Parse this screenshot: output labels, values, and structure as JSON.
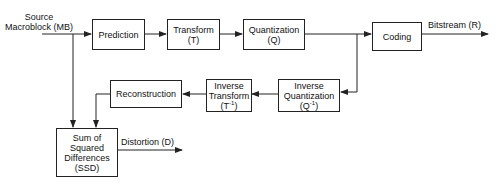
{
  "diagram": {
    "input_label": [
      "Source",
      "Macroblock (MB)"
    ],
    "nodes": {
      "prediction": {
        "lines": [
          "Prediction"
        ]
      },
      "transform": {
        "lines": [
          "Transform",
          "(T)"
        ]
      },
      "quantization": {
        "lines": [
          "Quantization",
          "(Q)"
        ]
      },
      "coding": {
        "lines": [
          "Coding"
        ]
      },
      "inverse_quantization": {
        "lines": [
          "Inverse",
          "Quantization"
        ],
        "symbol": "(Q",
        "sup": "-1",
        "close": ")"
      },
      "inverse_transform": {
        "lines": [
          "Inverse",
          "Transform"
        ],
        "symbol": "(T",
        "sup": "-1",
        "close": ")"
      },
      "reconstruction": {
        "lines": [
          "Reconstruction"
        ]
      },
      "ssd": {
        "lines": [
          "Sum of",
          "Squared",
          "Differences",
          "(SSD)"
        ]
      }
    },
    "output_labels": {
      "bitstream": "Bitstream (R)",
      "distortion": "Distortion (D)"
    },
    "edges": [
      [
        "Source Macroblock (MB)",
        "Prediction"
      ],
      [
        "Prediction",
        "Transform"
      ],
      [
        "Transform",
        "Quantization"
      ],
      [
        "Quantization",
        "Coding"
      ],
      [
        "Coding",
        "Bitstream (R)"
      ],
      [
        "Quantization",
        "Inverse Quantization"
      ],
      [
        "Inverse Quantization",
        "Inverse Transform"
      ],
      [
        "Inverse Transform",
        "Reconstruction"
      ],
      [
        "Reconstruction",
        "Sum of Squared Differences (SSD)"
      ],
      [
        "Source Macroblock (MB)",
        "Sum of Squared Differences (SSD)"
      ],
      [
        "Sum of Squared Differences (SSD)",
        "Distortion (D)"
      ]
    ]
  }
}
